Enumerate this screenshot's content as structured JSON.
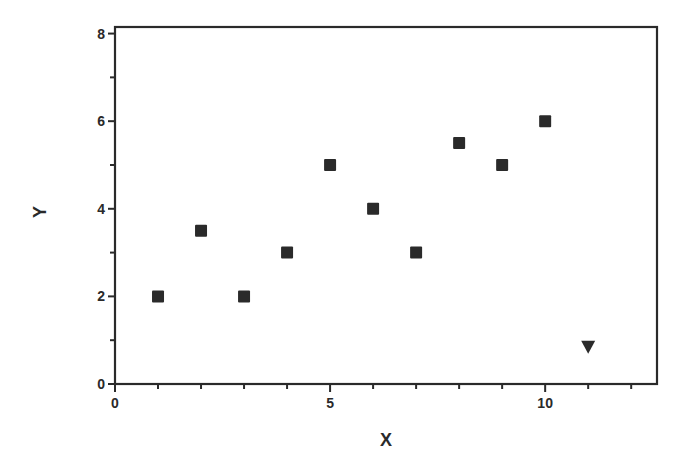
{
  "chart_data": {
    "type": "scatter",
    "title": "",
    "xlabel": "X",
    "ylabel": "Y",
    "xlim": [
      0,
      12.6
    ],
    "ylim": [
      0,
      8.15
    ],
    "xticks_major": [
      0,
      5,
      10
    ],
    "xticks_minor_step": 1,
    "yticks_major": [
      0,
      2,
      4,
      6,
      8
    ],
    "yticks_minor_step": 1,
    "grid": false,
    "legend": null,
    "series": [
      {
        "name": "squares",
        "marker": "square",
        "color": "#2a2a2a",
        "points": [
          {
            "x": 1,
            "y": 2
          },
          {
            "x": 2,
            "y": 3.5
          },
          {
            "x": 3,
            "y": 2
          },
          {
            "x": 4,
            "y": 3
          },
          {
            "x": 5,
            "y": 5
          },
          {
            "x": 6,
            "y": 4
          },
          {
            "x": 7,
            "y": 3
          },
          {
            "x": 8,
            "y": 5.5
          },
          {
            "x": 9,
            "y": 5
          },
          {
            "x": 10,
            "y": 6
          }
        ]
      },
      {
        "name": "triangle",
        "marker": "triangle-down",
        "color": "#2a2a2a",
        "points": [
          {
            "x": 11,
            "y": 0.85
          }
        ]
      }
    ]
  },
  "labels": {
    "x_axis": "X",
    "y_axis": "Y"
  }
}
